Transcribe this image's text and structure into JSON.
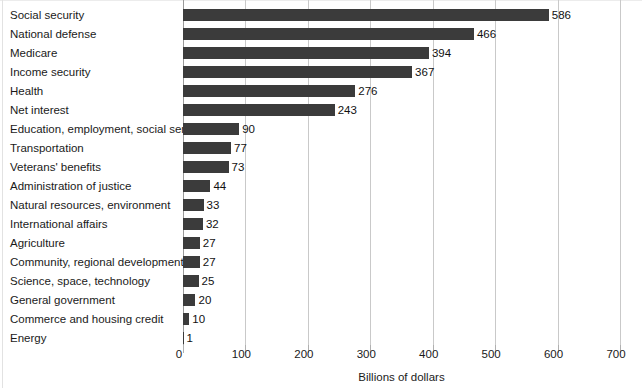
{
  "chart_data": {
    "type": "bar",
    "orientation": "horizontal",
    "title": "",
    "xlabel": "Billions of dollars",
    "ylabel": "",
    "xlim": [
      0,
      700
    ],
    "xticks": [
      0,
      100,
      200,
      300,
      400,
      500,
      600,
      700
    ],
    "xtick_labels": [
      "0",
      "100",
      "200",
      "300",
      "400",
      "500",
      "600",
      "700"
    ],
    "grid": true,
    "legend": null,
    "bar_color": "#3b3b3b",
    "gridline_color": "#c9c9c9",
    "categories": [
      "Social security",
      "National defense",
      "Medicare",
      "Income security",
      "Health",
      "Net interest",
      "Education, employment, social services",
      "Transportation",
      "Veterans' benefits",
      "Administration of justice",
      "Natural resources, environment",
      "International affairs",
      "Agriculture",
      "Community, regional development",
      "Science, space, technology",
      "General government",
      "Commerce and housing credit",
      "Energy"
    ],
    "values": [
      586,
      466,
      394,
      367,
      276,
      243,
      90,
      77,
      73,
      44,
      33,
      32,
      27,
      27,
      25,
      20,
      10,
      1
    ],
    "value_labels": [
      "586",
      "466",
      "394",
      "367",
      "276",
      "243",
      "90",
      "77",
      "73",
      "44",
      "33",
      "32",
      "27",
      "27",
      "25",
      "20",
      "10",
      "1"
    ]
  },
  "figure": {
    "caption_faint": ""
  }
}
